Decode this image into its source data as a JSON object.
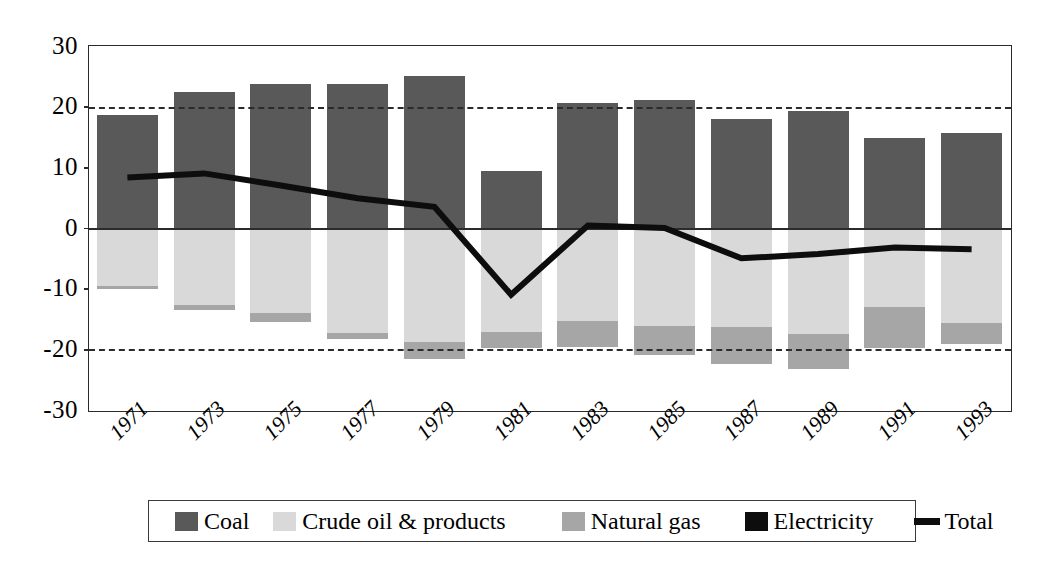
{
  "chart_data": {
    "type": "bar",
    "title": "",
    "subtitle": "",
    "xlabel": "",
    "ylabel": "",
    "ylim": [
      -30,
      30
    ],
    "yticks": [
      30,
      20,
      10,
      0,
      -10,
      -20,
      -30
    ],
    "ytick_labels": [
      "30",
      "20",
      "10",
      "0",
      "-10",
      "-20",
      "-30"
    ],
    "grid": "dashed gridlines at +20 and -20 only; solid zero line",
    "legend_position": "bottom",
    "stacked": true,
    "categories": [
      "1971",
      "1973",
      "1975",
      "1977",
      "1979",
      "1981",
      "1983",
      "1985",
      "1987",
      "1989",
      "1991",
      "1993"
    ],
    "series": [
      {
        "name": "Coal",
        "color": "#595959",
        "values": [
          18.6,
          22.4,
          23.7,
          23.8,
          25.0,
          9.4,
          20.6,
          21.1,
          17.9,
          19.3,
          14.9,
          15.7
        ]
      },
      {
        "name": "Crude oil & products",
        "color": "#d9d9d9",
        "values": [
          -9.5,
          -12.7,
          -14.0,
          -17.3,
          -18.8,
          -17.2,
          -15.4,
          -16.1,
          -16.3,
          -17.5,
          -13.0,
          -15.6
        ]
      },
      {
        "name": "Natural gas",
        "color": "#a6a6a6",
        "values": [
          -0.6,
          -0.9,
          -1.5,
          -1.0,
          -2.8,
          -2.6,
          -4.2,
          -4.9,
          -6.1,
          -5.8,
          -6.8,
          -3.6
        ]
      },
      {
        "name": "Electricity",
        "color": "#0d0d0d",
        "values": [
          0,
          0,
          0,
          0,
          0,
          0,
          0,
          0,
          0,
          0,
          0,
          0
        ]
      }
    ],
    "line_series": {
      "name": "Total",
      "color": "#0d0d0d",
      "values": [
        8.3,
        9.0,
        7.0,
        4.9,
        3.5,
        -11.0,
        0.4,
        0.0,
        -5.0,
        -4.3,
        -3.2,
        -3.5
      ]
    },
    "negative_totals": [
      -10.1,
      -13.6,
      -15.5,
      -18.3,
      -21.6,
      -19.8,
      -19.6,
      -21.0,
      -22.4,
      -23.3,
      -19.8,
      -19.2
    ]
  },
  "legend": {
    "items": [
      {
        "label": "Coal",
        "marker": "swatch-coal-icon",
        "color": "#595959"
      },
      {
        "label": "Crude oil & products",
        "marker": "swatch-oil-icon",
        "color": "#d9d9d9"
      },
      {
        "label": "Natural gas",
        "marker": "swatch-gas-icon",
        "color": "#a6a6a6"
      },
      {
        "label": "Electricity",
        "marker": "swatch-elec-icon",
        "color": "#0d0d0d"
      },
      {
        "label": "Total",
        "marker": "line-total-icon",
        "color": "#0d0d0d"
      }
    ]
  }
}
